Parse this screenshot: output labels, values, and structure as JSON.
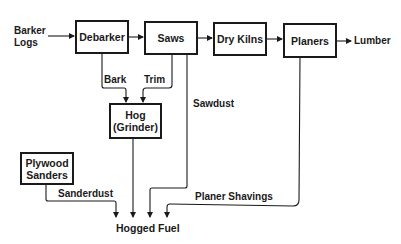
{
  "diagram": {
    "type": "process-flow",
    "input": {
      "line1": "Barker",
      "line2": "Logs"
    },
    "output": "Lumber",
    "sink": "Hogged Fuel",
    "nodes": {
      "debarker": "Debarker",
      "saws": "Saws",
      "dry_kilns": "Dry Kilns",
      "planers": "Planers",
      "hog": {
        "line1": "Hog",
        "line2": "(Grinder)"
      },
      "plywood_sanders": {
        "line1": "Plywood",
        "line2": "Sanders"
      }
    },
    "flows": {
      "bark": "Bark",
      "trim": "Trim",
      "sawdust": "Sawdust",
      "sanderdust": "Sanderdust",
      "planer_shavings": "Planer Shavings"
    },
    "edges": [
      [
        "Barker Logs",
        "Debarker"
      ],
      [
        "Debarker",
        "Saws"
      ],
      [
        "Saws",
        "Dry Kilns"
      ],
      [
        "Dry Kilns",
        "Planers"
      ],
      [
        "Planers",
        "Lumber"
      ],
      [
        "Debarker",
        "Hog (Grinder)",
        "Bark"
      ],
      [
        "Saws",
        "Hog (Grinder)",
        "Trim"
      ],
      [
        "Saws",
        "Hogged Fuel",
        "Sawdust"
      ],
      [
        "Hog (Grinder)",
        "Hogged Fuel"
      ],
      [
        "Plywood Sanders",
        "Hogged Fuel",
        "Sanderdust"
      ],
      [
        "Planers",
        "Hogged Fuel",
        "Planer Shavings"
      ]
    ]
  }
}
